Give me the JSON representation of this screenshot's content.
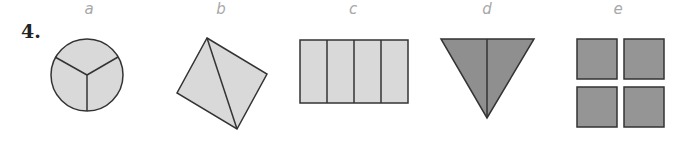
{
  "problem": {
    "number": "4."
  },
  "figures": [
    {
      "label": "a",
      "shape": "circle divided into 3 equal parts",
      "fill": "#d9d9d9"
    },
    {
      "label": "b",
      "shape": "square divided diagonally into 2 triangles",
      "fill": "#d9d9d9"
    },
    {
      "label": "c",
      "shape": "rectangle divided into 4 equal strips",
      "fill": "#d9d9d9"
    },
    {
      "label": "d",
      "shape": "inverted triangle divided into 2 halves",
      "fill": "#8f8f8f"
    },
    {
      "label": "e",
      "shape": "4 separate squares",
      "fill": "#959595"
    }
  ],
  "colors": {
    "stroke": "#333333",
    "light_fill": "#d9d9d9",
    "dark_fill": "#8f8f8f",
    "label": "#a8a8a8"
  }
}
